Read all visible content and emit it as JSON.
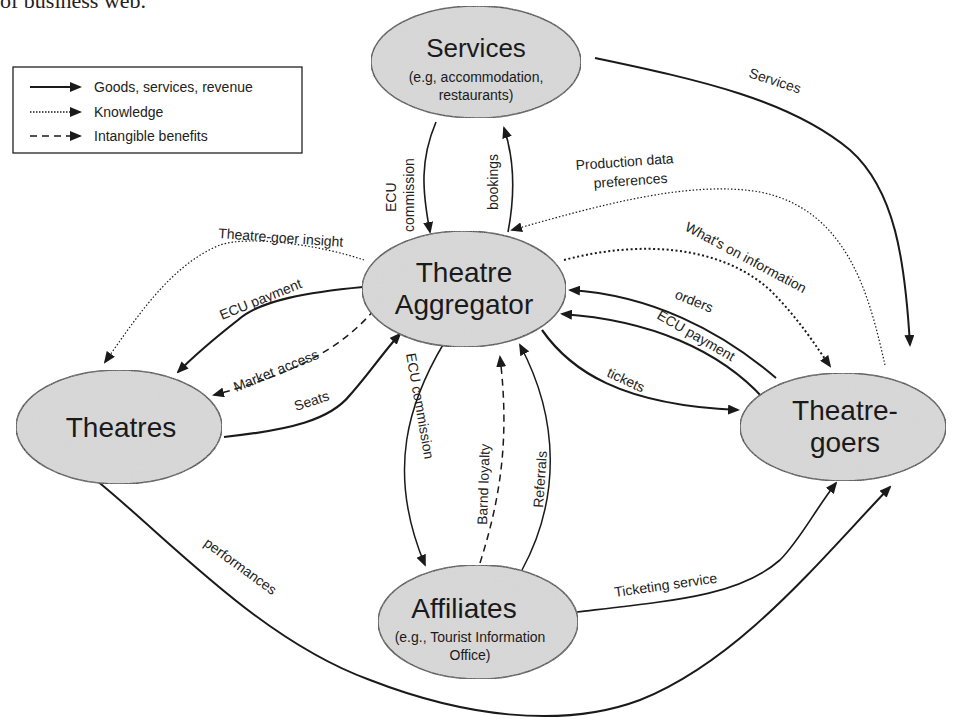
{
  "heading_fragment": "of business web.",
  "legend": {
    "items": [
      {
        "style": "solid",
        "label": "Goods, services, revenue"
      },
      {
        "style": "dotted",
        "label": "Knowledge"
      },
      {
        "style": "dashed",
        "label": "Intangible benefits"
      }
    ]
  },
  "nodes": {
    "services": {
      "title": "Services",
      "subtitle1": "(e.g, accommodation,",
      "subtitle2": "restaurants)"
    },
    "aggregator": {
      "title1": "Theatre",
      "title2": "Aggregator"
    },
    "theatres": {
      "title": "Theatres"
    },
    "theatregoers": {
      "title1": "Theatre-",
      "title2": "goers"
    },
    "affiliates": {
      "title": "Affiliates",
      "subtitle1": "(e.g., Tourist Information",
      "subtitle2": "Office)"
    }
  },
  "edges": {
    "ecu_commission_services": {
      "line1": "ECU",
      "line2": "commission",
      "type": "solid",
      "from": "Services",
      "to": "Theatre Aggregator"
    },
    "bookings": {
      "label": "bookings",
      "type": "solid",
      "from": "Theatre Aggregator",
      "to": "Services"
    },
    "services_to_goers": {
      "label": "Services",
      "type": "solid",
      "from": "Services",
      "to": "Theatre-goers"
    },
    "production_data": {
      "line1": "Production data",
      "line2": "preferences",
      "type": "dotted",
      "from": "Theatre-goers",
      "to": "Theatre Aggregator"
    },
    "whats_on": {
      "label": "What's on information",
      "type": "dotted",
      "from": "Theatre Aggregator",
      "to": "Theatre-goers"
    },
    "theatregoer_insight": {
      "label": "Theatre-goer insight",
      "type": "dotted",
      "from": "Theatre Aggregator",
      "to": "Theatres"
    },
    "ecu_payment_theatres": {
      "label": "ECU payment",
      "type": "solid",
      "from": "Theatre Aggregator",
      "to": "Theatres"
    },
    "market_access": {
      "label": "Market access",
      "type": "dashed",
      "from": "Theatre Aggregator",
      "to": "Theatres"
    },
    "seats": {
      "label": "Seats",
      "type": "solid",
      "from": "Theatres",
      "to": "Theatre Aggregator"
    },
    "orders": {
      "label": "orders",
      "type": "solid",
      "from": "Theatre-goers",
      "to": "Theatre Aggregator"
    },
    "ecu_payment_goers": {
      "label": "ECU payment",
      "type": "solid",
      "from": "Theatre-goers",
      "to": "Theatre Aggregator"
    },
    "tickets": {
      "label": "tickets",
      "type": "solid",
      "from": "Theatre Aggregator",
      "to": "Theatre-goers"
    },
    "ecu_commission_affiliates": {
      "label": "ECU commission",
      "type": "solid",
      "from": "Theatre Aggregator",
      "to": "Affiliates"
    },
    "brand_loyalty": {
      "label": "Barnd loyalty",
      "type": "dashed",
      "from": "Affiliates",
      "to": "Theatre Aggregator"
    },
    "referrals": {
      "label": "Referrals",
      "type": "solid",
      "from": "Affiliates",
      "to": "Theatre Aggregator"
    },
    "ticketing_service": {
      "label": "Ticketing service",
      "type": "solid",
      "from": "Affiliates",
      "to": "Theatre-goers"
    },
    "performances": {
      "label": "performances",
      "type": "solid",
      "from": "Theatres",
      "to": "Theatre-goers"
    }
  },
  "colors": {
    "node_fill": "#d4d4d4",
    "stroke": "#1a1a1a",
    "background": "#ffffff"
  }
}
